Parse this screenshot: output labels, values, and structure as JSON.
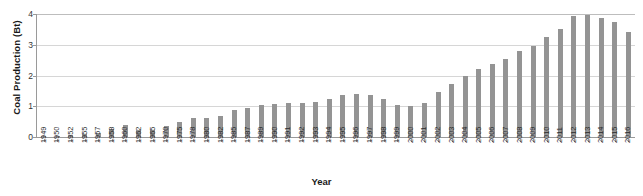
{
  "chart_data": {
    "type": "bar",
    "title": "",
    "xlabel": "Year",
    "ylabel": "Coal Production (Bt)",
    "ylim": [
      0,
      4
    ],
    "yticks": [
      0,
      1,
      2,
      3,
      4
    ],
    "grid": true,
    "legend": "none",
    "bar_color": "#949494",
    "categories": [
      "1949",
      "1950",
      "1952",
      "1955",
      "1957",
      "1958",
      "1960",
      "1962",
      "1965",
      "1970",
      "1975",
      "1978",
      "1980",
      "1982",
      "1985",
      "1987",
      "1989",
      "1990",
      "1991",
      "1992",
      "1993",
      "1994",
      "1995",
      "1996",
      "1997",
      "1998",
      "1999",
      "2000",
      "2001",
      "2002",
      "2003",
      "2004",
      "2005",
      "2006",
      "2007",
      "2008",
      "2009",
      "2010",
      "2011",
      "2012",
      "2013",
      "2014",
      "2015",
      "2016"
    ],
    "values": [
      0.03,
      0.04,
      0.07,
      0.1,
      0.13,
      0.27,
      0.4,
      0.22,
      0.23,
      0.35,
      0.48,
      0.62,
      0.62,
      0.67,
      0.87,
      0.93,
      1.05,
      1.08,
      1.09,
      1.12,
      1.15,
      1.24,
      1.36,
      1.4,
      1.37,
      1.25,
      1.05,
      1.0,
      1.11,
      1.45,
      1.72,
      1.99,
      2.2,
      2.37,
      2.53,
      2.8,
      2.97,
      3.24,
      3.52,
      3.95,
      3.97,
      3.87,
      3.75,
      3.41
    ]
  },
  "axes": {
    "y_title": "Coal Production (Bt)",
    "x_title": "Year"
  }
}
